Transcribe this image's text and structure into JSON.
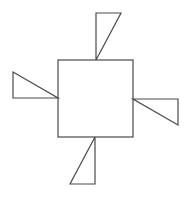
{
  "canvas": {
    "width": 189,
    "height": 197,
    "background": "#ffffff"
  },
  "style": {
    "stroke": "#4a4a4a",
    "stroke_width": 1.2,
    "fill": "none"
  },
  "square": {
    "x": 58,
    "y": 60,
    "width": 75,
    "height": 77
  },
  "triangles": [
    {
      "name": "top-triangle",
      "points": "96,13 121,13 96,60"
    },
    {
      "name": "left-triangle",
      "points": "13,72 13,98 58,98"
    },
    {
      "name": "right-triangle",
      "points": "133,99 178,99 178,125"
    },
    {
      "name": "bottom-triangle",
      "points": "95,137 95,184 70,184"
    }
  ]
}
